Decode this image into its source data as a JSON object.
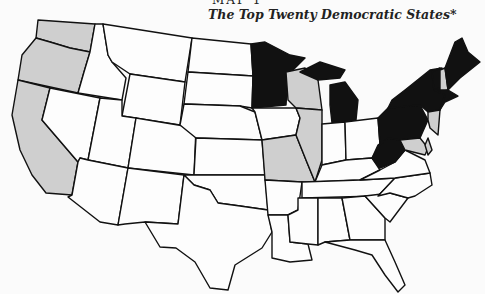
{
  "header": {
    "label": "MAP 1",
    "title": "The Top Twenty Democratic States*"
  },
  "legend_colors": {
    "top_tier": "#111111",
    "second_tier": "#cfcfcf",
    "other": "#fdfdfd"
  },
  "states": {
    "black": [
      "Minnesota",
      "Michigan",
      "Pennsylvania",
      "New York",
      "Vermont",
      "Maine",
      "Massachusetts",
      "Connecticut",
      "Rhode Island",
      "West Virginia"
    ],
    "gray": [
      "Washington",
      "Oregon",
      "California",
      "Wisconsin",
      "Illinois",
      "Missouri",
      "New Hampshire",
      "New Jersey",
      "Maryland",
      "Delaware"
    ]
  }
}
